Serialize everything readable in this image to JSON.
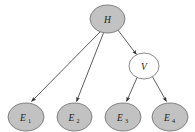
{
  "diagram": {
    "type": "directed-acyclic-graph",
    "title": "",
    "background_color": "#ffffff",
    "colors": {
      "node_fill_shaded": "#c2c2c2",
      "node_fill_unshaded": "#ffffff",
      "node_stroke": "#6b6b6b",
      "edge_stroke": "#4a4a4a",
      "label_color": "#1a1a1a"
    },
    "nodes": [
      {
        "id": "H",
        "label": "H",
        "subscript": "",
        "shaded": true,
        "cx": 107.5,
        "cy": 19,
        "rx": 17.5,
        "ry": 14
      },
      {
        "id": "V",
        "label": "V",
        "subscript": "",
        "shaded": false,
        "cx": 144,
        "cy": 66,
        "rx": 15,
        "ry": 13
      },
      {
        "id": "E1",
        "label": "E",
        "subscript": "1",
        "shaded": true,
        "cx": 26,
        "cy": 117,
        "rx": 18,
        "ry": 14
      },
      {
        "id": "E2",
        "label": "E",
        "subscript": "2",
        "shaded": true,
        "cx": 74.5,
        "cy": 117,
        "rx": 17.5,
        "ry": 14
      },
      {
        "id": "E3",
        "label": "E",
        "subscript": "3",
        "shaded": true,
        "cx": 123,
        "cy": 117,
        "rx": 18,
        "ry": 14
      },
      {
        "id": "E4",
        "label": "E",
        "subscript": "4",
        "shaded": true,
        "cx": 170,
        "cy": 117,
        "rx": 18,
        "ry": 14
      }
    ],
    "edges": [
      {
        "from": "H",
        "to": "E1",
        "arrow": true
      },
      {
        "from": "H",
        "to": "E2",
        "arrow": true
      },
      {
        "from": "H",
        "to": "V",
        "arrow": true
      },
      {
        "from": "V",
        "to": "E3",
        "arrow": true
      },
      {
        "from": "V",
        "to": "E4",
        "arrow": true
      }
    ]
  }
}
